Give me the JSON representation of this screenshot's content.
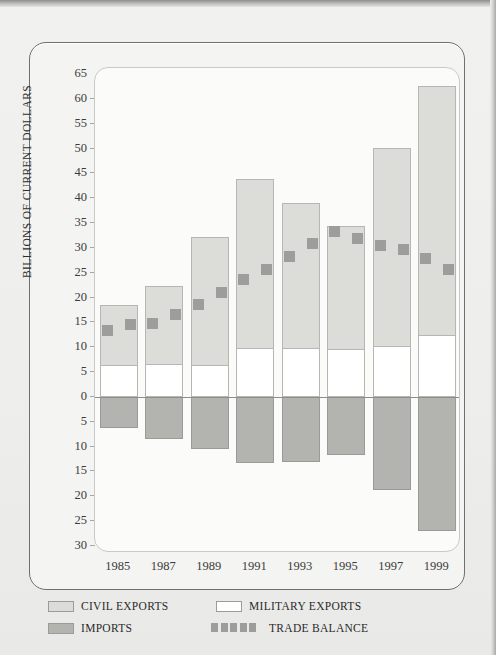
{
  "chart_data": {
    "type": "bar",
    "title": "",
    "subtitle": "",
    "xlabel": "",
    "ylabel": "BILLIONS OF CURRENT DOLLARS",
    "grid": false,
    "legend_position": "bottom",
    "categories": [
      "1985",
      "1987",
      "1989",
      "1991",
      "1993",
      "1995",
      "1997",
      "1999"
    ],
    "x_tick_labels": [
      "1985",
      "1987",
      "1989",
      "1991",
      "1993",
      "1995",
      "1997",
      "1999"
    ],
    "y_tick_labels": [
      "65",
      "60",
      "55",
      "50",
      "45",
      "40",
      "35",
      "30",
      "25",
      "20",
      "15",
      "10",
      "5",
      "0",
      "5",
      "10",
      "15",
      "20",
      "25",
      "30"
    ],
    "y_tick_values": [
      65,
      60,
      55,
      50,
      45,
      40,
      35,
      30,
      25,
      20,
      15,
      10,
      5,
      0,
      -5,
      -10,
      -15,
      -20,
      -25,
      -30
    ],
    "ylim": [
      -30,
      65
    ],
    "series": [
      {
        "name": "CIVIL EXPORTS",
        "color": "#dcdcd9",
        "stack": "exports",
        "values": [
          12.2,
          16.0,
          25.9,
          34.2,
          29.4,
          25.0,
          40.1,
          50.3
        ]
      },
      {
        "name": "MILITARY EXPORTS",
        "color": "#ffffff",
        "stack": "exports",
        "values": [
          6.3,
          6.4,
          6.3,
          9.6,
          9.6,
          9.4,
          10.0,
          12.3
        ]
      },
      {
        "name": "IMPORTS",
        "color": "#b3b3b0",
        "stack": "imports",
        "values": [
          -6.2,
          -8.4,
          -10.5,
          -13.3,
          -13.1,
          -11.7,
          -18.7,
          -26.9
        ]
      }
    ],
    "stacked_totals_exports": [
      18.5,
      22.4,
      32.2,
      43.8,
      39.0,
      34.4,
      50.1,
      62.6
    ],
    "trade_balance": {
      "name": "TRADE BALANCE",
      "color": "#9d9d9b",
      "marker": "square",
      "years": [
        1984,
        1985,
        1986,
        1987,
        1988,
        1989,
        1990,
        1991,
        1992,
        1993,
        1994,
        1995,
        1996,
        1997,
        1998,
        1999
      ],
      "values": [
        13.3,
        14.6,
        14.8,
        16.6,
        18.7,
        21.1,
        23.7,
        25.6,
        28.3,
        30.8,
        33.3,
        31.8,
        30.5,
        29.7,
        27.8,
        25.7
      ]
    }
  },
  "legend": {
    "items": [
      {
        "label": "CIVIL EXPORTS",
        "swatch": "civil"
      },
      {
        "label": "MILITARY EXPORTS",
        "swatch": "military"
      },
      {
        "label": "IMPORTS",
        "swatch": "imports"
      },
      {
        "label": "TRADE BALANCE",
        "swatch": "trade-balance"
      }
    ]
  },
  "colors": {
    "page_background": "#eeeeec",
    "card_background": "#f4f4f2",
    "plot_background": "#fbfbf9",
    "civil_exports": "#dcdcd9",
    "military_exports": "#ffffff",
    "imports": "#b3b3b0",
    "trade_balance": "#9d9d9b",
    "axis_text": "#3b3b3b",
    "frame_border": "#6f6f6d"
  }
}
